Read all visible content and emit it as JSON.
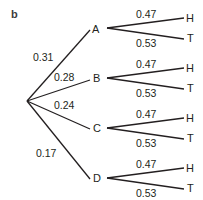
{
  "figure": {
    "panel_label": "b",
    "type": "probability tree diagram"
  },
  "tree": {
    "root": "",
    "first_level": [
      {
        "node": "A",
        "prob": "0.31"
      },
      {
        "node": "B",
        "prob": "0.28"
      },
      {
        "node": "C",
        "prob": "0.24"
      },
      {
        "node": "D",
        "prob": "0.17"
      }
    ],
    "second_level": [
      {
        "parent": "A",
        "upper": {
          "node": "H",
          "prob": "0.47"
        },
        "lower": {
          "node": "T",
          "prob": "0.53"
        }
      },
      {
        "parent": "B",
        "upper": {
          "node": "H",
          "prob": "0.47"
        },
        "lower": {
          "node": "T",
          "prob": "0.53"
        }
      },
      {
        "parent": "C",
        "upper": {
          "node": "H",
          "prob": "0.47"
        },
        "lower": {
          "node": "T",
          "prob": "0.53"
        }
      },
      {
        "parent": "D",
        "upper": {
          "node": "H",
          "prob": "0.47"
        },
        "lower": {
          "node": "T",
          "prob": "0.53"
        }
      }
    ]
  },
  "colors": {
    "line": "#231f20",
    "text": "#231f20",
    "background": "#ffffff"
  }
}
